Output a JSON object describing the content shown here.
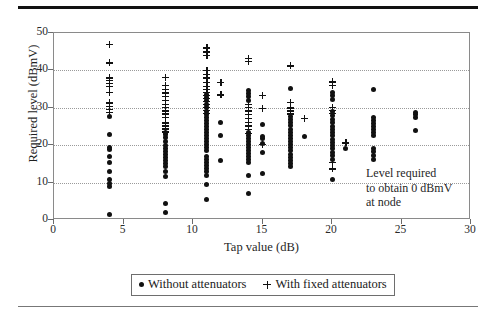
{
  "chart_data": {
    "type": "scatter",
    "title": "",
    "xlabel": "Tap value (dB)",
    "ylabel": "Required level (dBmV)",
    "xlim": [
      0,
      30
    ],
    "ylim": [
      0,
      50
    ],
    "xticks": [
      0,
      5,
      10,
      15,
      20,
      25,
      30
    ],
    "yticks": [
      0,
      10,
      20,
      30,
      40,
      50
    ],
    "grid": "horizontal-dotted",
    "legend_position": "below-axis-centered",
    "annotations": [
      {
        "name": "level-required-note",
        "lines": [
          "Level required",
          "to obtain 0 dBmV",
          "at node"
        ],
        "x": 22.5,
        "y": 17.5
      }
    ],
    "series": [
      {
        "name": "Without attenuators",
        "marker": "dot",
        "color": "#111111",
        "points": [
          [
            4,
            1.5
          ],
          [
            4,
            9.0
          ],
          [
            4,
            9.8
          ],
          [
            4,
            10.8
          ],
          [
            4,
            13.0
          ],
          [
            4,
            15.5
          ],
          [
            4,
            17.0
          ],
          [
            4,
            18.8
          ],
          [
            4,
            19.4
          ],
          [
            4,
            22.8
          ],
          [
            4,
            27.8
          ],
          [
            8,
            2.0
          ],
          [
            8,
            4.3
          ],
          [
            8,
            11.5
          ],
          [
            8,
            13.0
          ],
          [
            8,
            14.3
          ],
          [
            8,
            15.2
          ],
          [
            8,
            16.0
          ],
          [
            8,
            16.8
          ],
          [
            8,
            17.5
          ],
          [
            8,
            18.4
          ],
          [
            8,
            19.2
          ],
          [
            8,
            20.0
          ],
          [
            8,
            21.0
          ],
          [
            8,
            22.0
          ],
          [
            8,
            22.8
          ],
          [
            8,
            23.4
          ],
          [
            11,
            5.4
          ],
          [
            11,
            9.6
          ],
          [
            11,
            12.0
          ],
          [
            11,
            13.0
          ],
          [
            11,
            13.8
          ],
          [
            11,
            14.6
          ],
          [
            11,
            15.4
          ],
          [
            11,
            16.2
          ],
          [
            11,
            17.0
          ],
          [
            11,
            18.6
          ],
          [
            11,
            19.4
          ],
          [
            11,
            20.2
          ],
          [
            11,
            21.0
          ],
          [
            11,
            21.8
          ],
          [
            11,
            22.6
          ],
          [
            11,
            23.4
          ],
          [
            11,
            24.2
          ],
          [
            11,
            25.0
          ],
          [
            11,
            25.8
          ],
          [
            11,
            26.6
          ],
          [
            11,
            27.4
          ],
          [
            11,
            28.2
          ],
          [
            11,
            29.0
          ],
          [
            11,
            30.0
          ],
          [
            11,
            31.0
          ],
          [
            11,
            32.0
          ],
          [
            11,
            32.8
          ],
          [
            11,
            33.6
          ],
          [
            12,
            15.9
          ],
          [
            12,
            22.5
          ],
          [
            12,
            26.0
          ],
          [
            14,
            7.0
          ],
          [
            14,
            11.8
          ],
          [
            14,
            15.4
          ],
          [
            14,
            16.2
          ],
          [
            14,
            17.0
          ],
          [
            14,
            17.8
          ],
          [
            14,
            18.6
          ],
          [
            14,
            19.4
          ],
          [
            14,
            20.2
          ],
          [
            14,
            21.0
          ],
          [
            14,
            21.8
          ],
          [
            14,
            22.6
          ],
          [
            14,
            23.4
          ],
          [
            14,
            32.0
          ],
          [
            14,
            33.0
          ],
          [
            14,
            33.8
          ],
          [
            14,
            34.5
          ],
          [
            15,
            12.5
          ],
          [
            15,
            18.1
          ],
          [
            15,
            20.4
          ],
          [
            15,
            21.8
          ],
          [
            15,
            22.4
          ],
          [
            15,
            25.5
          ],
          [
            17,
            14.2
          ],
          [
            17,
            15.0
          ],
          [
            17,
            15.9
          ],
          [
            17,
            16.8
          ],
          [
            17,
            17.6
          ],
          [
            17,
            18.5
          ],
          [
            17,
            19.3
          ],
          [
            17,
            20.2
          ],
          [
            17,
            21.0
          ],
          [
            17,
            21.8
          ],
          [
            17,
            22.6
          ],
          [
            17,
            23.5
          ],
          [
            17,
            24.3
          ],
          [
            17,
            25.2
          ],
          [
            17,
            26.0
          ],
          [
            17,
            26.8
          ],
          [
            17,
            27.6
          ],
          [
            17,
            35.2
          ],
          [
            18,
            22.3
          ],
          [
            20,
            10.8
          ],
          [
            20,
            16.3
          ],
          [
            20,
            17.2
          ],
          [
            20,
            18.1
          ],
          [
            20,
            19.0
          ],
          [
            20,
            19.9
          ],
          [
            20,
            20.8
          ],
          [
            20,
            21.6
          ],
          [
            20,
            22.5
          ],
          [
            20,
            23.4
          ],
          [
            20,
            24.2
          ],
          [
            20,
            25.1
          ],
          [
            20,
            26.0
          ],
          [
            20,
            27.0
          ],
          [
            20,
            28.0
          ],
          [
            20,
            29.0
          ],
          [
            20,
            32.3
          ],
          [
            20,
            33.2
          ],
          [
            20,
            34.2
          ],
          [
            21,
            19.1
          ],
          [
            23,
            16.3
          ],
          [
            23,
            17.2
          ],
          [
            23,
            18.2
          ],
          [
            23,
            19.2
          ],
          [
            23,
            22.6
          ],
          [
            23,
            23.4
          ],
          [
            23,
            24.2
          ],
          [
            23,
            25.0
          ],
          [
            23,
            25.8
          ],
          [
            23,
            26.6
          ],
          [
            23,
            27.4
          ],
          [
            23,
            34.8
          ],
          [
            26,
            24.0
          ],
          [
            26,
            27.4
          ],
          [
            26,
            28.2
          ],
          [
            26,
            28.8
          ]
        ]
      },
      {
        "name": "With fixed attenuators",
        "marker": "plus",
        "color": "#111111",
        "points": [
          [
            4,
            28.8
          ],
          [
            4,
            29.6
          ],
          [
            4,
            30.4
          ],
          [
            4,
            31.3
          ],
          [
            4,
            34.2
          ],
          [
            4,
            35.8
          ],
          [
            4,
            36.6
          ],
          [
            4,
            37.4
          ],
          [
            4,
            38.0
          ],
          [
            4,
            42.0
          ],
          [
            4,
            47.0
          ],
          [
            8,
            23.6
          ],
          [
            8,
            24.4
          ],
          [
            8,
            25.2
          ],
          [
            8,
            26.0
          ],
          [
            8,
            27.5
          ],
          [
            8,
            28.4
          ],
          [
            8,
            29.2
          ],
          [
            8,
            30.2
          ],
          [
            8,
            31.0
          ],
          [
            8,
            32.0
          ],
          [
            8,
            33.0
          ],
          [
            8,
            34.0
          ],
          [
            8,
            35.0
          ],
          [
            8,
            36.0
          ],
          [
            8,
            38.2
          ],
          [
            11,
            28.6
          ],
          [
            11,
            29.4
          ],
          [
            11,
            30.2
          ],
          [
            11,
            31.0
          ],
          [
            11,
            31.8
          ],
          [
            11,
            32.6
          ],
          [
            11,
            33.4
          ],
          [
            11,
            34.2
          ],
          [
            11,
            35.0
          ],
          [
            11,
            35.8
          ],
          [
            11,
            36.8
          ],
          [
            11,
            38.0
          ],
          [
            11,
            39.0
          ],
          [
            11,
            40.0
          ],
          [
            11,
            44.0
          ],
          [
            11,
            45.0
          ],
          [
            11,
            46.0
          ],
          [
            12,
            33.5
          ],
          [
            12,
            36.8
          ],
          [
            14,
            23.2
          ],
          [
            14,
            24.2
          ],
          [
            14,
            25.2
          ],
          [
            14,
            26.2
          ],
          [
            14,
            27.2
          ],
          [
            14,
            28.2
          ],
          [
            14,
            29.2
          ],
          [
            14,
            30.2
          ],
          [
            14,
            31.0
          ],
          [
            14,
            42.5
          ],
          [
            14,
            43.2
          ],
          [
            15,
            20.3
          ],
          [
            15,
            29.9
          ],
          [
            15,
            33.4
          ],
          [
            17,
            28.4
          ],
          [
            17,
            29.2
          ],
          [
            17,
            30.0
          ],
          [
            17,
            31.5
          ],
          [
            17,
            41.2
          ],
          [
            18,
            27.2
          ],
          [
            20,
            13.7
          ],
          [
            20,
            15.4
          ],
          [
            20,
            28.5
          ],
          [
            20,
            29.4
          ],
          [
            20,
            30.2
          ],
          [
            20,
            36.0
          ],
          [
            20,
            37.0
          ],
          [
            21,
            20.6
          ]
        ]
      }
    ]
  },
  "legend": {
    "entries": [
      {
        "marker": "dot",
        "label": "Without attenuators"
      },
      {
        "marker": "plus",
        "label": "With fixed attenuators"
      }
    ]
  },
  "axis": {
    "y_title": "Required level (dBmV)",
    "x_title": "Tap value (dB)",
    "y_tick_labels": [
      "0",
      "10",
      "20",
      "30",
      "40",
      "50"
    ],
    "x_tick_labels": [
      "0",
      "5",
      "10",
      "15",
      "20",
      "25",
      "30"
    ]
  },
  "annotation": {
    "line1": "Level required",
    "line2": "to obtain 0 dBmV",
    "line3": "at node"
  }
}
